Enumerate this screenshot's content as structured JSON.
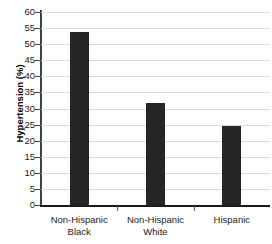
{
  "chart_data": {
    "type": "bar",
    "title": "",
    "xlabel": "",
    "ylabel": "Hypertension (%)",
    "categories": [
      "Non-Hispanic Black",
      "Non-Hispanic White",
      "Hispanic"
    ],
    "category_lines": [
      [
        "Non-Hispanic",
        "Black"
      ],
      [
        "Non-Hispanic",
        "White"
      ],
      [
        "Hispanic"
      ]
    ],
    "values": [
      53.7,
      31.7,
      24.5
    ],
    "ylim": [
      0,
      60
    ],
    "ytick_step": 5,
    "yticks": [
      0,
      5,
      10,
      15,
      20,
      25,
      30,
      35,
      40,
      45,
      50,
      55,
      60
    ],
    "ytick_labels": [
      "0",
      "5",
      "10",
      "15",
      "20",
      "25",
      "30",
      "35",
      "40",
      "45",
      "50",
      "55",
      "60"
    ],
    "grid": true,
    "legend": false,
    "bar_color": "#262626",
    "gridline_color": "#d9d9d9",
    "axis_color": "#1a1a1a"
  }
}
